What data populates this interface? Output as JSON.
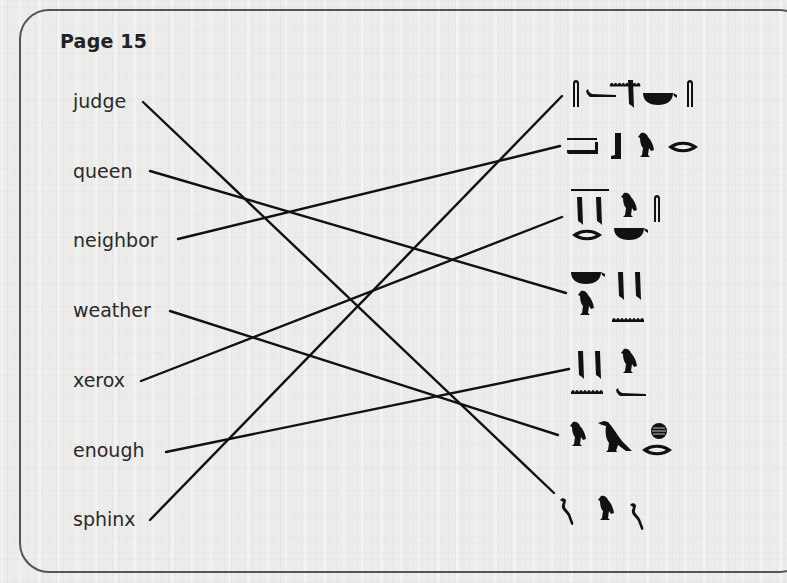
{
  "page": {
    "title": "Page 15"
  },
  "words": [
    {
      "label": "judge",
      "top": 90
    },
    {
      "label": "queen",
      "top": 160
    },
    {
      "label": "neighbor",
      "top": 229
    },
    {
      "label": "weather",
      "top": 299
    },
    {
      "label": "xerox",
      "top": 369
    },
    {
      "label": "enough",
      "top": 439
    },
    {
      "label": "sphinx",
      "top": 508
    }
  ],
  "hieroglyph_groups": [
    {
      "index": 1,
      "signs": [
        "reed-leaf",
        "horned-viper",
        "folded-cloth",
        "basket",
        "water-ripple",
        "reed-leaf"
      ]
    },
    {
      "index": 2,
      "signs": [
        "water-ripple",
        "pool",
        "leg",
        "vulture",
        "mouth"
      ]
    },
    {
      "index": 3,
      "signs": [
        "double-reed",
        "mouth",
        "vulture",
        "basket",
        "reed-leaf"
      ]
    },
    {
      "index": 4,
      "signs": [
        "basket",
        "vulture",
        "double-reed",
        "water-ripple"
      ]
    },
    {
      "index": 5,
      "signs": [
        "double-reed",
        "water-ripple",
        "vulture",
        "horned-viper"
      ]
    },
    {
      "index": 6,
      "signs": [
        "vulture",
        "ibis",
        "placenta",
        "mouth"
      ]
    },
    {
      "index": 7,
      "signs": [
        "cobra",
        "vulture",
        "cobra"
      ]
    }
  ],
  "matches": [
    {
      "word": "judge",
      "glyph_group": 7,
      "x1": 143,
      "y1": 102,
      "x2": 554,
      "y2": 493
    },
    {
      "word": "queen",
      "glyph_group": 4,
      "x1": 150,
      "y1": 171,
      "x2": 566,
      "y2": 293
    },
    {
      "word": "neighbor",
      "glyph_group": 2,
      "x1": 178,
      "y1": 239,
      "x2": 560,
      "y2": 146
    },
    {
      "word": "weather",
      "glyph_group": 6,
      "x1": 170,
      "y1": 311,
      "x2": 558,
      "y2": 435
    },
    {
      "word": "xerox",
      "glyph_group": 3,
      "x1": 141,
      "y1": 381,
      "x2": 562,
      "y2": 217
    },
    {
      "word": "enough",
      "glyph_group": 5,
      "x1": 166,
      "y1": 452,
      "x2": 569,
      "y2": 369
    },
    {
      "word": "sphinx",
      "glyph_group": 1,
      "x1": 150,
      "y1": 520,
      "x2": 562,
      "y2": 96
    }
  ],
  "colors": {
    "ink": "#111111",
    "border": "#555555",
    "paper": "#ececea"
  }
}
